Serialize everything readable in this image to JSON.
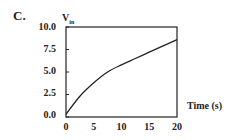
{
  "panel_label": "C.",
  "chart_data": {
    "type": "line",
    "title": "",
    "xlabel": "Time (s)",
    "ylabel": "V",
    "ylabel_subscript": "in",
    "xlim": [
      0,
      20
    ],
    "ylim": [
      0,
      10
    ],
    "xticks": [
      "0",
      "5",
      "10",
      "15",
      "20"
    ],
    "yticks": [
      "0.0",
      "2.5",
      "5.0",
      "7.5",
      "10.0"
    ],
    "grid": false,
    "legend": null,
    "series": [
      {
        "name": "Vin",
        "x": [
          0,
          2.5,
          5,
          7.5,
          10,
          12.5,
          15,
          17.5,
          20
        ],
        "y": [
          0.3,
          2.3,
          3.8,
          5.0,
          5.8,
          6.5,
          7.2,
          7.9,
          8.6
        ]
      }
    ]
  }
}
